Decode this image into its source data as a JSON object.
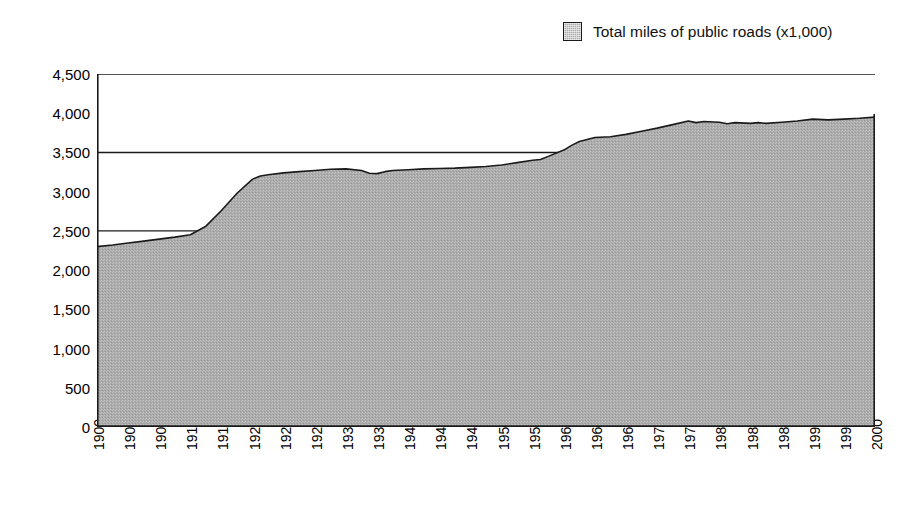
{
  "legend": {
    "swatch_name": "legend-color-swatch",
    "label": "Total miles of public roads (x1,000)",
    "swatch_color": "#a9a9a9",
    "swatch_border_color": "#1a1a1a"
  },
  "chart_data": {
    "type": "area",
    "title": "",
    "subtitle": "",
    "xlabel": "",
    "ylabel": "",
    "legend_position": "top-right",
    "grid": true,
    "gridline_values": [
      2500,
      3500,
      4500
    ],
    "ylim": [
      0,
      4500
    ],
    "xlim": [
      1900,
      2000
    ],
    "ytick_labels": [
      "0",
      "500",
      "1,000",
      "1,500",
      "2,000",
      "2,500",
      "3,000",
      "3,500",
      "4,000",
      "4,500"
    ],
    "ytick_values": [
      0,
      500,
      1000,
      1500,
      2000,
      2500,
      3000,
      3500,
      4000,
      4500
    ],
    "xtick_labels": [
      "1900",
      "1904",
      "1908",
      "1912",
      "1916",
      "1920",
      "1924",
      "1928",
      "1932",
      "1936",
      "1940",
      "1944",
      "1948",
      "1952",
      "1956",
      "1960",
      "1964",
      "1968",
      "1972",
      "1976",
      "1980",
      "1984",
      "1988",
      "1992",
      "1996",
      "2000"
    ],
    "series": [
      {
        "name": "Total miles of public roads (x1,000)",
        "fill_color": "#a9a9a9",
        "line_color": "#1a1a1a",
        "x": [
          1900,
          1902,
          1904,
          1906,
          1908,
          1910,
          1912,
          1914,
          1916,
          1918,
          1920,
          1921,
          1922,
          1924,
          1926,
          1928,
          1930,
          1932,
          1934,
          1935,
          1936,
          1937,
          1938,
          1940,
          1942,
          1944,
          1946,
          1948,
          1950,
          1952,
          1954,
          1956,
          1957,
          1958,
          1960,
          1961,
          1962,
          1964,
          1966,
          1968,
          1970,
          1972,
          1974,
          1976,
          1977,
          1978,
          1980,
          1981,
          1982,
          1984,
          1985,
          1986,
          1988,
          1990,
          1992,
          1994,
          1996,
          1998,
          2000
        ],
        "values": [
          2300,
          2320,
          2345,
          2370,
          2395,
          2420,
          2450,
          2560,
          2760,
          2980,
          3160,
          3200,
          3215,
          3240,
          3255,
          3270,
          3285,
          3290,
          3270,
          3235,
          3230,
          3255,
          3270,
          3280,
          3290,
          3295,
          3300,
          3310,
          3320,
          3340,
          3370,
          3400,
          3410,
          3450,
          3530,
          3590,
          3640,
          3690,
          3700,
          3730,
          3770,
          3810,
          3855,
          3900,
          3880,
          3895,
          3885,
          3865,
          3880,
          3870,
          3880,
          3870,
          3885,
          3900,
          3925,
          3915,
          3925,
          3935,
          3950
        ]
      }
    ]
  }
}
